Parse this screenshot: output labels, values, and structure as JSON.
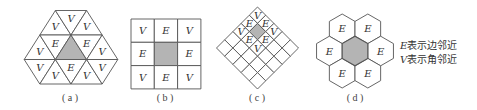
{
  "figure": {
    "panels": [
      {
        "id": "a",
        "caption": "( a )",
        "tiling": "triangular",
        "labels": {
          "top_row": [
            "V",
            "V",
            "V"
          ],
          "upper_row": [
            "V",
            "E",
            "E",
            "V"
          ],
          "lower_row": [
            "V",
            "V",
            "E",
            "V",
            "V"
          ]
        }
      },
      {
        "id": "b",
        "caption": "( b )",
        "tiling": "square",
        "grid": [
          [
            "V",
            "E",
            "V"
          ],
          [
            "E",
            "",
            "E"
          ],
          [
            "V",
            "E",
            "V"
          ]
        ]
      },
      {
        "id": "c",
        "caption": "( c )",
        "tiling": "rotated-square",
        "labels": [
          "V",
          "E",
          "E",
          "V",
          "V",
          "E",
          "E",
          "V"
        ]
      },
      {
        "id": "d",
        "caption": "( d )",
        "tiling": "hexagonal",
        "labels": [
          "E",
          "E",
          "E",
          "E",
          "E",
          "E"
        ]
      }
    ],
    "legend": {
      "edge": {
        "symbol": "E",
        "text": "表示边邻近"
      },
      "vertex": {
        "symbol": "V",
        "text": "表示角邻近"
      }
    },
    "colors": {
      "line": "#555555",
      "shaded_cell": "#b4b4b4",
      "background": "#ffffff"
    }
  }
}
